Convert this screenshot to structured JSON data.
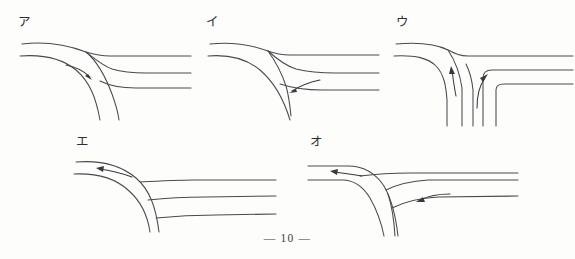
{
  "page": {
    "page_number_text": "— 10 —",
    "background_color": "#fdfdfc",
    "line_color": "#4a4a4e",
    "arrow_color": "#3a3a3e"
  },
  "figures": [
    {
      "id": "a",
      "label": "ア",
      "description": "Y-junction: main road curves from upper-left down to bottom; a branch splits off to the right. One arrow points right-and-down along the inner lane.",
      "arrow_count": 1,
      "arrow_directions": [
        "right-down"
      ],
      "junction_type": "curved-fork",
      "corner_style": "rounded"
    },
    {
      "id": "i",
      "label": "イ",
      "description": "Y-junction: road from upper-left curves down to bottom; branch merges from the right. One arrow points left along the branch toward the junction.",
      "arrow_count": 1,
      "arrow_directions": [
        "left"
      ],
      "junction_type": "curved-fork",
      "corner_style": "rounded"
    },
    {
      "id": "u",
      "label": "ウ",
      "description": "T-junction with square corners: vertical roads at bottom meet horizontal roads at right. Two arrows point upward/left indicating traffic turning.",
      "arrow_count": 2,
      "arrow_directions": [
        "up-left",
        "up-right"
      ],
      "junction_type": "square-tee",
      "corner_style": "square"
    },
    {
      "id": "e",
      "label": "エ",
      "description": "Sweeping curve from bottom to upper-left; horizontal lanes terminate against the curve on the right. One arrow points left along the curve.",
      "arrow_count": 1,
      "arrow_directions": [
        "left"
      ],
      "junction_type": "curved-bend",
      "corner_style": "rounded"
    },
    {
      "id": "o",
      "label": "オ",
      "description": "Y-junction: road curves from bottom up to the left; a branch comes in from the right. Two arrows both point left.",
      "arrow_count": 2,
      "arrow_directions": [
        "left",
        "left"
      ],
      "junction_type": "curved-fork",
      "corner_style": "rounded"
    }
  ]
}
